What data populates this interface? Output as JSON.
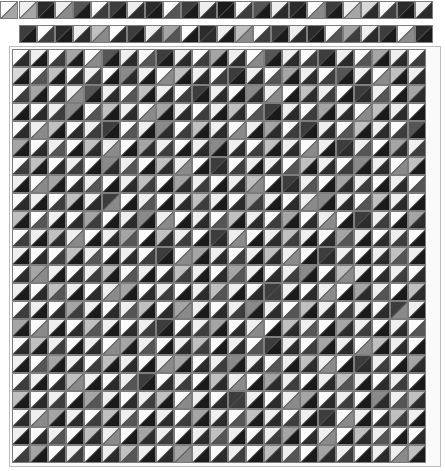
{
  "view": {
    "title": "Triangle Shading Matrix",
    "background_color": "#ffffff",
    "cell_size_px": 18,
    "cell_border_color": "#7d7d7d",
    "diagonal_color": "#4a4a4a",
    "frame_border_color": "#bdbdbd",
    "split": "anti-diagonal",
    "palette": [
      "#1a1a1a",
      "#2b2b2b",
      "#3d3d3d",
      "#555555",
      "#6e6e6e",
      "#8a8a8a",
      "#a5a5a5",
      "#c0c0c0",
      "#d8d8d8",
      "#efefef",
      "#fbfbfb"
    ]
  },
  "chart_data": {
    "type": "heatmap",
    "xlabel": "",
    "ylabel": "",
    "grid": true,
    "legend": "none",
    "encoding": "each cell is a square split along the anti-diagonal into an upper-left triangle and a lower-right triangle; each triangle carries its own gray level",
    "value_range": [
      0,
      10
    ],
    "palette": [
      "#1a1a1a",
      "#2b2b2b",
      "#3d3d3d",
      "#555555",
      "#6e6e6e",
      "#8a8a8a",
      "#a5a5a5",
      "#c0c0c0",
      "#d8d8d8",
      "#efefef",
      "#fbfbfb"
    ],
    "corner_cell": {
      "upper_left": 10,
      "lower_right": 6
    },
    "strip_rows": [
      {
        "name": "strip-row-1",
        "upper_left": [
          9,
          1,
          9,
          3,
          10,
          2,
          9,
          1,
          10,
          2,
          9,
          0,
          10,
          3,
          9,
          1,
          10,
          2,
          9,
          8,
          10,
          1,
          9
        ],
        "lower_right": [
          6,
          0,
          5,
          0,
          2,
          0,
          1,
          0,
          3,
          0,
          1,
          0,
          2,
          0,
          1,
          0,
          5,
          0,
          6,
          1,
          2,
          0,
          1
        ]
      },
      {
        "name": "strip-row-2",
        "upper_left": [
          2,
          10,
          1,
          9,
          7,
          10,
          2,
          9,
          6,
          10,
          1,
          9,
          7,
          10,
          2,
          9,
          1,
          10,
          6,
          9,
          2,
          10,
          1
        ],
        "lower_right": [
          0,
          2,
          0,
          1,
          5,
          1,
          0,
          2,
          3,
          0,
          1,
          0,
          5,
          2,
          0,
          1,
          0,
          3,
          2,
          1,
          0,
          5,
          0
        ]
      }
    ],
    "matrix_upper_left": [
      [
        10,
        9,
        10,
        6,
        10,
        3,
        9,
        10,
        2,
        9,
        10,
        6,
        9,
        10,
        3,
        9,
        10,
        2,
        9,
        10,
        6,
        9,
        10
      ],
      [
        8,
        10,
        7,
        10,
        9,
        10,
        5,
        9,
        10,
        7,
        9,
        10,
        2,
        9,
        10,
        6,
        9,
        10,
        3,
        9,
        10,
        7,
        9
      ],
      [
        10,
        6,
        10,
        9,
        3,
        9,
        10,
        7,
        9,
        10,
        2,
        9,
        10,
        5,
        9,
        10,
        7,
        9,
        10,
        2,
        9,
        10,
        6
      ],
      [
        9,
        10,
        9,
        5,
        10,
        7,
        9,
        10,
        6,
        9,
        10,
        9,
        7,
        10,
        2,
        9,
        10,
        6,
        9,
        10,
        7,
        9,
        10
      ],
      [
        10,
        9,
        7,
        10,
        9,
        2,
        10,
        9,
        5,
        10,
        7,
        9,
        10,
        9,
        6,
        10,
        2,
        9,
        10,
        7,
        9,
        10,
        3
      ],
      [
        6,
        10,
        9,
        10,
        7,
        9,
        10,
        6,
        9,
        10,
        9,
        5,
        9,
        10,
        7,
        9,
        10,
        9,
        2,
        9,
        10,
        6,
        9
      ],
      [
        10,
        7,
        10,
        9,
        10,
        5,
        9,
        10,
        7,
        9,
        10,
        2,
        10,
        9,
        9,
        10,
        7,
        9,
        10,
        5,
        9,
        10,
        7
      ],
      [
        9,
        10,
        6,
        10,
        9,
        10,
        9,
        7,
        10,
        6,
        9,
        10,
        9,
        7,
        10,
        2,
        9,
        10,
        6,
        9,
        10,
        9,
        10
      ],
      [
        10,
        9,
        10,
        7,
        9,
        2,
        10,
        9,
        10,
        9,
        7,
        9,
        10,
        6,
        9,
        10,
        9,
        5,
        9,
        10,
        7,
        9,
        10
      ],
      [
        7,
        10,
        9,
        10,
        6,
        10,
        9,
        5,
        9,
        10,
        9,
        10,
        7,
        9,
        10,
        6,
        10,
        9,
        10,
        2,
        9,
        10,
        6
      ],
      [
        10,
        9,
        7,
        9,
        10,
        9,
        6,
        10,
        7,
        9,
        10,
        2,
        9,
        10,
        9,
        7,
        9,
        10,
        6,
        9,
        10,
        9,
        10
      ],
      [
        9,
        10,
        10,
        7,
        9,
        10,
        9,
        10,
        2,
        10,
        6,
        9,
        10,
        9,
        7,
        9,
        10,
        2,
        9,
        10,
        9,
        7,
        9
      ],
      [
        10,
        6,
        9,
        10,
        9,
        7,
        10,
        9,
        10,
        7,
        9,
        10,
        6,
        9,
        10,
        9,
        5,
        10,
        7,
        9,
        10,
        9,
        10
      ],
      [
        9,
        10,
        7,
        9,
        10,
        9,
        6,
        10,
        9,
        10,
        9,
        7,
        9,
        10,
        2,
        9,
        10,
        9,
        10,
        6,
        9,
        10,
        7
      ],
      [
        10,
        9,
        10,
        6,
        9,
        10,
        9,
        7,
        10,
        6,
        9,
        10,
        9,
        5,
        9,
        10,
        7,
        9,
        10,
        9,
        10,
        2,
        9
      ],
      [
        6,
        10,
        9,
        10,
        7,
        9,
        10,
        9,
        2,
        10,
        9,
        6,
        10,
        9,
        10,
        7,
        9,
        10,
        6,
        9,
        10,
        9,
        10
      ],
      [
        10,
        7,
        9,
        10,
        9,
        10,
        6,
        9,
        10,
        9,
        7,
        10,
        9,
        10,
        2,
        9,
        10,
        6,
        9,
        10,
        7,
        9,
        10
      ],
      [
        9,
        10,
        6,
        9,
        10,
        7,
        9,
        10,
        9,
        6,
        10,
        9,
        5,
        9,
        10,
        9,
        7,
        9,
        10,
        2,
        9,
        10,
        6
      ],
      [
        10,
        9,
        10,
        7,
        9,
        10,
        9,
        2,
        10,
        9,
        10,
        7,
        9,
        10,
        6,
        9,
        10,
        9,
        7,
        9,
        10,
        9,
        10
      ],
      [
        7,
        10,
        9,
        10,
        6,
        9,
        10,
        9,
        7,
        10,
        9,
        10,
        2,
        9,
        10,
        9,
        6,
        10,
        9,
        10,
        5,
        9,
        7
      ],
      [
        10,
        9,
        6,
        9,
        10,
        7,
        9,
        10,
        9,
        10,
        6,
        9,
        10,
        7,
        9,
        10,
        9,
        2,
        10,
        9,
        10,
        7,
        9
      ],
      [
        9,
        10,
        9,
        10,
        7,
        9,
        10,
        6,
        9,
        10,
        9,
        7,
        9,
        10,
        9,
        6,
        10,
        9,
        10,
        7,
        9,
        10,
        10
      ],
      [
        10,
        6,
        10,
        9,
        10,
        9,
        7,
        9,
        10,
        6,
        9,
        10,
        9,
        10,
        7,
        9,
        10,
        6,
        9,
        10,
        9,
        9,
        7
      ]
    ],
    "matrix_lower_right": [
      [
        1,
        0,
        2,
        0,
        5,
        0,
        1,
        3,
        0,
        1,
        2,
        0,
        1,
        5,
        0,
        1,
        2,
        0,
        1,
        3,
        0,
        1,
        2
      ],
      [
        0,
        3,
        0,
        1,
        2,
        0,
        1,
        0,
        5,
        0,
        1,
        2,
        0,
        1,
        3,
        0,
        1,
        2,
        0,
        1,
        5,
        0,
        1
      ],
      [
        2,
        0,
        1,
        5,
        0,
        1,
        3,
        0,
        1,
        2,
        0,
        1,
        0,
        1,
        5,
        0,
        1,
        2,
        0,
        1,
        3,
        0,
        1
      ],
      [
        0,
        1,
        2,
        0,
        3,
        0,
        1,
        5,
        0,
        1,
        2,
        0,
        1,
        3,
        0,
        1,
        2,
        0,
        1,
        5,
        0,
        1,
        0
      ],
      [
        1,
        5,
        0,
        1,
        2,
        0,
        3,
        0,
        1,
        2,
        0,
        1,
        5,
        0,
        1,
        2,
        0,
        1,
        3,
        0,
        1,
        2,
        0
      ],
      [
        0,
        1,
        3,
        0,
        1,
        5,
        0,
        1,
        2,
        0,
        1,
        0,
        1,
        2,
        0,
        1,
        5,
        0,
        1,
        3,
        0,
        1,
        2
      ],
      [
        2,
        0,
        1,
        2,
        0,
        1,
        3,
        0,
        1,
        5,
        0,
        1,
        2,
        0,
        1,
        3,
        0,
        1,
        2,
        0,
        1,
        5,
        0
      ],
      [
        0,
        5,
        0,
        1,
        3,
        0,
        1,
        2,
        0,
        1,
        2,
        0,
        1,
        5,
        0,
        1,
        3,
        0,
        1,
        2,
        0,
        1,
        3
      ],
      [
        1,
        0,
        2,
        0,
        1,
        5,
        0,
        3,
        0,
        1,
        2,
        0,
        1,
        2,
        0,
        1,
        5,
        0,
        1,
        3,
        0,
        1,
        0
      ],
      [
        0,
        3,
        0,
        1,
        2,
        0,
        1,
        0,
        5,
        0,
        1,
        3,
        0,
        1,
        2,
        0,
        1,
        5,
        0,
        1,
        2,
        0,
        1
      ],
      [
        2,
        0,
        1,
        5,
        0,
        1,
        3,
        0,
        1,
        2,
        0,
        1,
        5,
        0,
        1,
        2,
        0,
        1,
        3,
        0,
        1,
        2,
        0
      ],
      [
        0,
        1,
        2,
        0,
        3,
        0,
        1,
        2,
        0,
        5,
        0,
        1,
        2,
        0,
        1,
        5,
        0,
        1,
        2,
        0,
        1,
        3,
        0
      ],
      [
        1,
        5,
        0,
        1,
        2,
        0,
        3,
        0,
        1,
        2,
        0,
        1,
        3,
        0,
        1,
        2,
        0,
        1,
        5,
        0,
        1,
        2,
        1
      ],
      [
        0,
        1,
        3,
        0,
        1,
        5,
        0,
        1,
        2,
        0,
        1,
        3,
        0,
        1,
        2,
        0,
        1,
        5,
        0,
        1,
        3,
        0,
        1
      ],
      [
        2,
        0,
        1,
        2,
        0,
        1,
        3,
        0,
        1,
        5,
        0,
        1,
        2,
        0,
        1,
        3,
        0,
        1,
        2,
        0,
        1,
        5,
        0
      ],
      [
        0,
        5,
        0,
        1,
        3,
        0,
        1,
        2,
        0,
        1,
        2,
        0,
        1,
        5,
        0,
        1,
        3,
        0,
        1,
        2,
        0,
        1,
        3
      ],
      [
        1,
        0,
        2,
        0,
        1,
        5,
        0,
        3,
        0,
        1,
        2,
        0,
        1,
        3,
        0,
        1,
        2,
        0,
        1,
        5,
        0,
        1,
        0
      ],
      [
        0,
        3,
        0,
        1,
        2,
        0,
        1,
        0,
        5,
        0,
        1,
        2,
        0,
        1,
        3,
        0,
        1,
        5,
        0,
        1,
        2,
        0,
        1
      ],
      [
        2,
        0,
        1,
        5,
        0,
        1,
        3,
        0,
        1,
        2,
        0,
        1,
        5,
        0,
        1,
        2,
        0,
        1,
        3,
        0,
        1,
        2,
        0
      ],
      [
        0,
        1,
        2,
        0,
        3,
        0,
        1,
        2,
        0,
        5,
        0,
        1,
        2,
        0,
        1,
        5,
        0,
        1,
        2,
        0,
        1,
        3,
        1
      ],
      [
        1,
        5,
        0,
        1,
        2,
        0,
        3,
        0,
        1,
        2,
        0,
        1,
        3,
        0,
        1,
        2,
        0,
        1,
        5,
        0,
        1,
        2,
        0
      ],
      [
        0,
        1,
        3,
        0,
        1,
        5,
        0,
        1,
        2,
        0,
        1,
        3,
        0,
        1,
        2,
        0,
        1,
        5,
        0,
        1,
        3,
        0,
        1
      ],
      [
        2,
        0,
        1,
        2,
        0,
        1,
        3,
        0,
        1,
        5,
        0,
        1,
        2,
        0,
        1,
        3,
        0,
        1,
        2,
        0,
        1,
        5,
        0
      ]
    ]
  }
}
